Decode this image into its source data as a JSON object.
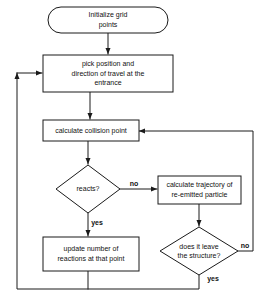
{
  "diagram": {
    "background_color": "#ffffff",
    "line_color": "#1a1a1a",
    "text_color": "#111111",
    "nodes": {
      "start": {
        "shape": "terminator",
        "lines": [
          "Initialize grid",
          "points"
        ]
      },
      "pick_position": {
        "shape": "process",
        "lines": [
          "pick position and",
          "direction of travel at the",
          "entrance"
        ]
      },
      "collision": {
        "shape": "process",
        "lines": [
          "calculate collision point"
        ]
      },
      "reacts": {
        "shape": "decision",
        "lines": [
          "reacts?"
        ]
      },
      "trajectory": {
        "shape": "process",
        "lines": [
          "calculate trajectory of",
          "re-emitted particle"
        ]
      },
      "update": {
        "shape": "process",
        "lines": [
          "update number of",
          "reactions at that point"
        ]
      },
      "leaves": {
        "shape": "decision",
        "lines": [
          "does it leave",
          "the structure?"
        ]
      }
    },
    "edge_labels": {
      "reacts_no": "no",
      "reacts_yes": "yes",
      "leaves_no": "no",
      "leaves_yes": "yes"
    }
  }
}
